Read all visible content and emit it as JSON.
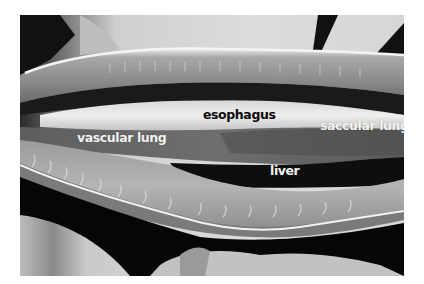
{
  "figure": {
    "labels": {
      "esophagus": "esophagus",
      "vascular_lung": "vascular lung",
      "saccular_lung": "saccular lung",
      "liver": "liver"
    },
    "colors": {
      "background": "#ffffff",
      "label_dark": "#0a0a0a",
      "label_light": "#f4f4f4"
    }
  }
}
